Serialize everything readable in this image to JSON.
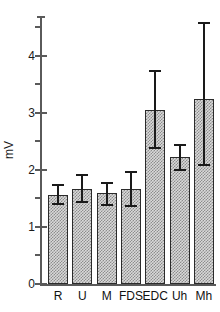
{
  "chart_data": {
    "type": "bar",
    "title": "",
    "xlabel": "",
    "ylabel": "mV",
    "ylim": [
      0,
      4.7
    ],
    "grid": false,
    "legend": null,
    "y_major_ticks": [
      0,
      1,
      2,
      3,
      4
    ],
    "y_major_tick_labels": [
      "0",
      "1",
      "2",
      "3",
      "4"
    ],
    "y_minor_ticks": [
      0.5,
      1.5,
      2.5,
      3.5,
      4.5
    ],
    "categories": [
      "R",
      "U",
      "M",
      "FDS",
      "EDC",
      "Uh",
      "Mh"
    ],
    "values": [
      1.56,
      1.67,
      1.6,
      1.67,
      3.05,
      2.22,
      3.24
    ],
    "errors_upper": [
      1.73,
      1.92,
      1.78,
      1.97,
      3.73,
      2.43,
      4.58
    ],
    "errors_lower": [
      1.4,
      1.43,
      1.39,
      1.36,
      2.39,
      2.0,
      2.09
    ],
    "series": [
      {
        "name": "mV",
        "values": [
          1.56,
          1.67,
          1.6,
          1.67,
          3.05,
          2.22,
          3.24
        ]
      }
    ],
    "bar_fill": "#d9d9d9",
    "bar_hatch_color": "#8d8d8d",
    "bar_edge_color": "#2b2b2b",
    "axis_color": "#5a5a5a",
    "text_color": "#1a1a1a"
  }
}
